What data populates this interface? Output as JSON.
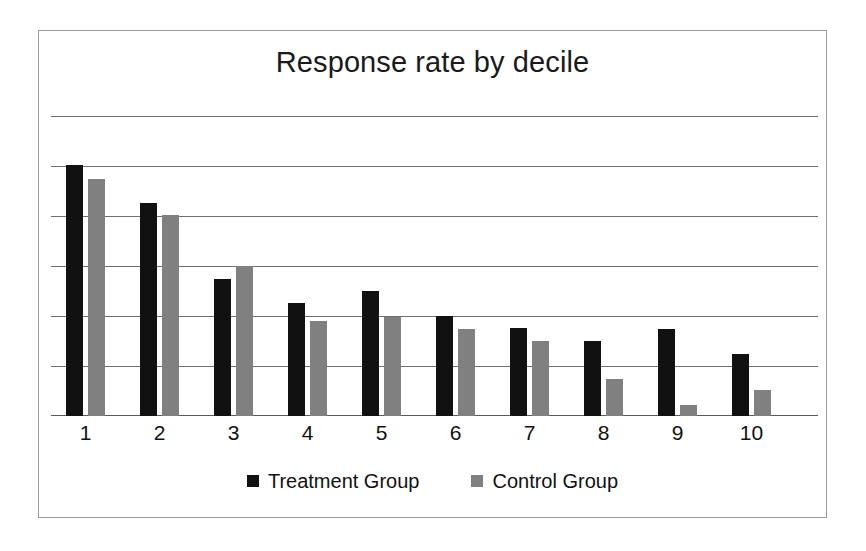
{
  "chart": {
    "title": "Response rate by decile",
    "frame_border_color": "#9a9a9a",
    "gridline_color": "#6f6f6f",
    "background": "#ffffff"
  },
  "legend": {
    "position": "bottom-center",
    "entries": [
      {
        "label": "Treatment Group",
        "color": "#111111",
        "swatch": "square-swatch"
      },
      {
        "label": "Control Group",
        "color": "#808080",
        "swatch": "square-swatch"
      }
    ]
  },
  "chart_data": {
    "type": "bar",
    "title": "Response rate by decile",
    "xlabel": "",
    "ylabel": "",
    "categories": [
      "1",
      "2",
      "3",
      "4",
      "5",
      "6",
      "7",
      "8",
      "9",
      "10"
    ],
    "series": [
      {
        "name": "Treatment Group",
        "color": "#111111",
        "values": [
          25.1,
          21.3,
          13.7,
          11.3,
          12.5,
          10.0,
          8.8,
          7.5,
          8.7,
          6.2
        ]
      },
      {
        "name": "Control Group",
        "color": "#808080",
        "values": [
          23.7,
          20.1,
          15.0,
          9.5,
          9.9,
          8.7,
          7.5,
          3.7,
          1.1,
          2.6
        ]
      }
    ],
    "ylim": [
      0,
      30
    ],
    "y_gridline_values": [
      30,
      25,
      20,
      15,
      10,
      5,
      0
    ],
    "y_tick_labels_visible": false,
    "grid": true,
    "units": "percent"
  }
}
